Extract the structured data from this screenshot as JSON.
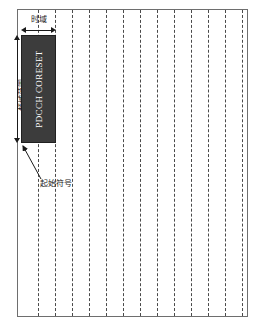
{
  "figure": {
    "name": "pdcch-coreset-resource-grid",
    "background_color": "#ffffff",
    "frame_border_color": "#6e6e6e"
  },
  "grid": {
    "symbol_line_color": "#4a4a4a",
    "symbol_line_style": "dashed",
    "symbol_line_count": 13,
    "symbol_line_x": [
      38,
      55,
      72,
      89,
      106,
      123,
      140,
      157,
      174,
      191,
      208,
      225,
      242
    ]
  },
  "coreset": {
    "label": "PDCCH CORESET",
    "fill_color": "#3c3c3c",
    "text_color": "#ffffff",
    "orientation": "vertical"
  },
  "annotations": {
    "time_domain_label": "时域",
    "frequency_domain_label": "频域范围",
    "start_symbol_label": "起始符号",
    "arrow_color": "#1a1a1a"
  },
  "chart_data": {
    "type": "diagram",
    "title": "",
    "axes": {
      "horizontal": {
        "label": "时域",
        "unit": "OFDM symbol",
        "tick_count": 13
      },
      "vertical": {
        "label": "频域范围",
        "unit": "subcarrier / RB"
      }
    },
    "regions": [
      {
        "name": "PDCCH CORESET",
        "time_start_symbol": 0,
        "time_duration_symbols": 2,
        "frequency_extent": "partial",
        "fill": "#3c3c3c"
      }
    ],
    "callouts": [
      {
        "text": "起始符号",
        "points_to": "PDCCH CORESET bottom-left corner (start symbol)"
      },
      {
        "text": "时域",
        "points_to": "horizontal extent of the CORESET"
      },
      {
        "text": "频域范围",
        "points_to": "vertical extent of the CORESET"
      }
    ]
  }
}
